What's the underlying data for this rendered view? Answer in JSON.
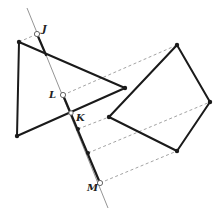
{
  "diagram": {
    "labels": {
      "J": "J",
      "L": "L",
      "K": "K",
      "M": "M"
    },
    "shapes": [
      "triangle",
      "quadrilateral"
    ],
    "projection_line": "line through J, L, K, M"
  }
}
